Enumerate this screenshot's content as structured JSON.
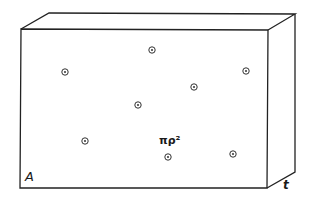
{
  "diagram": {
    "labels": {
      "area": "A",
      "thickness": "t",
      "cross_section": "πρ²"
    },
    "stroke_color": "#222222",
    "points": [
      {
        "x": 65,
        "y": 72
      },
      {
        "x": 152,
        "y": 50
      },
      {
        "x": 246,
        "y": 71
      },
      {
        "x": 194,
        "y": 87
      },
      {
        "x": 138,
        "y": 105
      },
      {
        "x": 85,
        "y": 141
      },
      {
        "x": 168,
        "y": 157
      },
      {
        "x": 233,
        "y": 154
      }
    ]
  }
}
